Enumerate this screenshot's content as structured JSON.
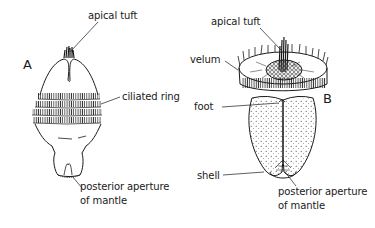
{
  "figure": {
    "panels": [
      {
        "id": "A",
        "letter": "A",
        "labels": {
          "apical_tuft": "apical tuft",
          "ciliated_ring": "ciliated ring",
          "posterior_aperture_line1": "posterior aperture",
          "posterior_aperture_line2": "of mantle"
        }
      },
      {
        "id": "B",
        "letter": "B",
        "labels": {
          "apical_tuft": "apical tuft",
          "velum": "velum",
          "foot": "foot",
          "shell": "shell",
          "posterior_aperture_line1": "posterior aperture",
          "posterior_aperture_line2": "of mantle"
        }
      }
    ],
    "colors": {
      "ink": "#1a1a1a",
      "background": "#ffffff"
    }
  }
}
